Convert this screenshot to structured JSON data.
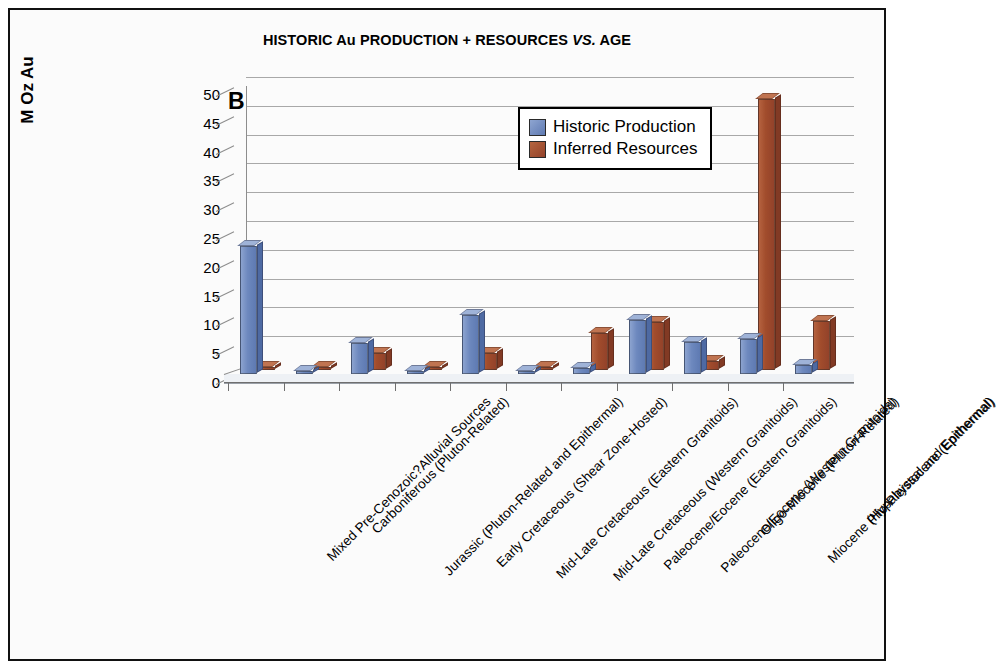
{
  "figure": {
    "panel_letter": "B",
    "title_main": "HISTORIC Au PRODUCTION + RESOURCES ",
    "title_italic": "VS.",
    "title_tail": " AGE",
    "border_color": "#111111",
    "background": "#ffffff"
  },
  "legend": {
    "position": "inside-top-right",
    "entries": [
      {
        "label": "Historic Production",
        "color": "#6d88be"
      },
      {
        "label": "Inferred Resources",
        "color": "#a14c2c"
      }
    ]
  },
  "axes": {
    "ylabel": "M Oz Au",
    "yticks": [
      0,
      5,
      10,
      15,
      20,
      25,
      30,
      35,
      40,
      45,
      50
    ],
    "ymin": 0,
    "ymax": 50,
    "grid": true,
    "xlabel": ""
  },
  "chart_data": {
    "type": "bar",
    "title": "HISTORIC Au PRODUCTION + RESOURCES VS. AGE",
    "xlabel": "",
    "ylabel": "M Oz Au",
    "ylim": [
      0,
      50
    ],
    "yticks": [
      0,
      5,
      10,
      15,
      20,
      25,
      30,
      35,
      40,
      45,
      50
    ],
    "grid": true,
    "legend_position": "upper center-right",
    "categories": [
      "Mixed Pre-Cenozoic?Alluvial Sources",
      "Carboniferous (Pluton-Related)",
      "Jurassic (Pluton-Related and Epithermal)",
      "Early Cretaceous (Shear Zone-Hosted)",
      "Mid-Late Cretaceous (Eastern Granitoids)",
      "Mid-Late Cretaceous (Western Granitoids)",
      "Paleocene/Eocene (Eastern Granitoids)",
      "Paleocene/Eocene (Western Granitoids)",
      "Oligo-Miocene (Pluton-Related)",
      "Miocene (Hypabyssal and Epithermal)",
      "Plio-Pleistocene (Epithermal)"
    ],
    "series": [
      {
        "name": "Historic Production",
        "color": "#6d88be",
        "values": [
          22.2,
          0.4,
          5.4,
          0.5,
          10.2,
          0.5,
          1.0,
          9.4,
          5.6,
          6.0,
          1.6
        ]
      },
      {
        "name": "Inferred Resources",
        "color": "#a14c2c",
        "values": [
          0.6,
          0.5,
          3.0,
          0.4,
          3.0,
          0.6,
          6.5,
          8.4,
          1.6,
          47.0,
          8.5
        ]
      }
    ],
    "units": "M Oz Au"
  }
}
